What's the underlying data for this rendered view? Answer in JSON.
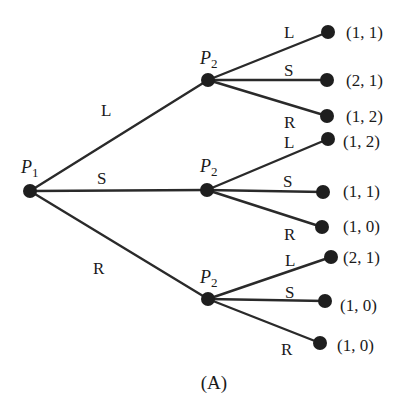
{
  "diagram": {
    "caption": "(A)",
    "root": {
      "player": "P",
      "player_sub": "1",
      "moves": [
        "L",
        "S",
        "R"
      ]
    },
    "subgames": [
      {
        "via": "L",
        "player": "P",
        "player_sub": "2",
        "moves": [
          "L",
          "S",
          "R"
        ],
        "payoffs": [
          "(1, 1)",
          "(2, 1)",
          "(1, 2)"
        ]
      },
      {
        "via": "S",
        "player": "P",
        "player_sub": "2",
        "moves": [
          "L",
          "S",
          "R"
        ],
        "payoffs": [
          "(1, 2)",
          "(1, 1)",
          "(1, 0)"
        ]
      },
      {
        "via": "R",
        "player": "P",
        "player_sub": "2",
        "moves": [
          "L",
          "S",
          "R"
        ],
        "payoffs": [
          "(2, 1)",
          "(1, 0)",
          "(1, 0)"
        ]
      }
    ],
    "colors": {
      "ink": "#1e1e1e",
      "background": "#ffffff"
    }
  }
}
